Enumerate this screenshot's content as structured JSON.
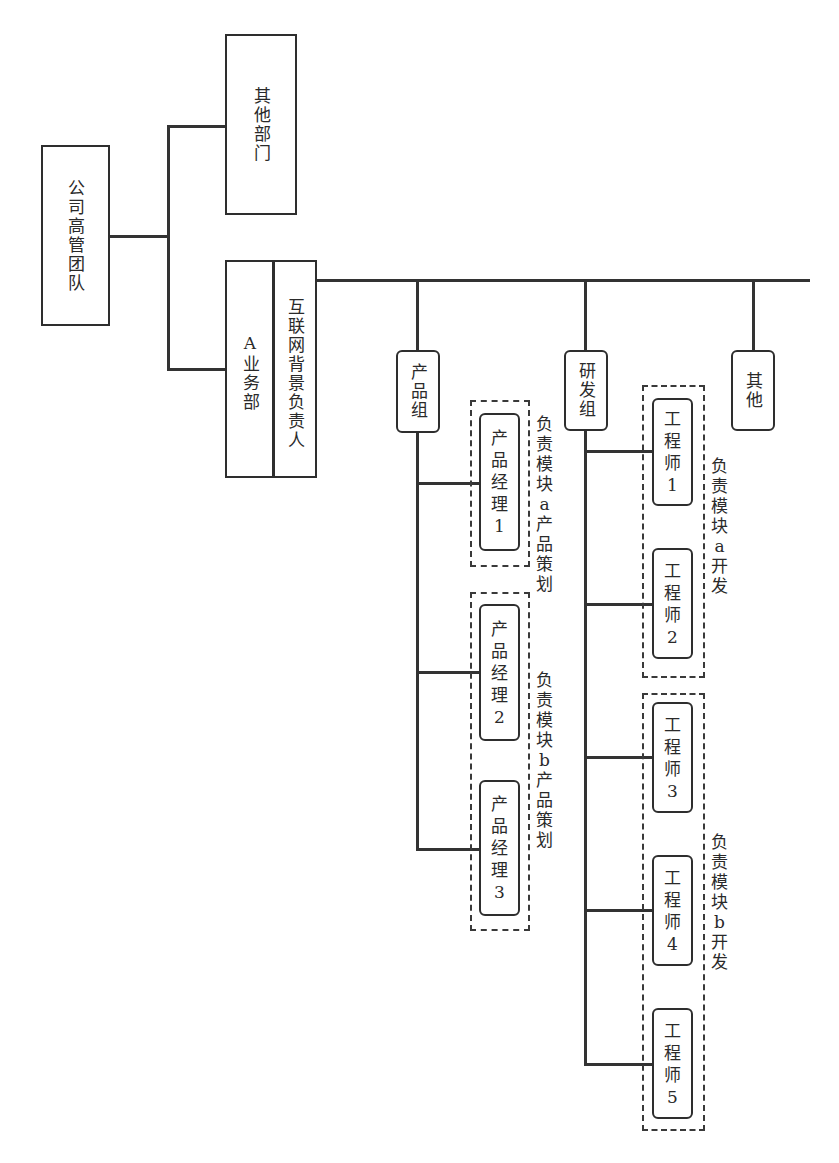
{
  "diagram": {
    "type": "org-chart",
    "nodes": {
      "executive_team": "公司高管团队",
      "other_departments": "其他部门",
      "business_dept_a": "A业务部",
      "internet_lead": "互联网背景负责人",
      "product_group": "产品组",
      "rd_group": "研发组",
      "others": "其他",
      "pm1": [
        "产",
        "品",
        "经",
        "理",
        "1"
      ],
      "pm2": [
        "产",
        "品",
        "经",
        "理",
        "2"
      ],
      "pm3": [
        "产",
        "品",
        "经",
        "理",
        "3"
      ],
      "eng1": [
        "工",
        "程",
        "师",
        "1"
      ],
      "eng2": [
        "工",
        "程",
        "师",
        "2"
      ],
      "eng3": [
        "工",
        "程",
        "师",
        "3"
      ],
      "eng4": [
        "工",
        "程",
        "师",
        "4"
      ],
      "eng5": [
        "工",
        "程",
        "师",
        "5"
      ]
    },
    "annotations": {
      "module_a_product": [
        "负",
        "责",
        "模",
        "块",
        "a",
        "产",
        "品",
        "策",
        "划"
      ],
      "module_b_product": [
        "负",
        "责",
        "模",
        "块",
        "b",
        "产",
        "品",
        "策",
        "划"
      ],
      "module_a_dev": [
        "负",
        "责",
        "模",
        "块",
        "a",
        "开",
        "发"
      ],
      "module_b_dev": [
        "负",
        "责",
        "模",
        "块",
        "b",
        "开",
        "发"
      ]
    },
    "edges": [
      [
        "公司高管团队",
        "其他部门"
      ],
      [
        "公司高管团队",
        "A业务部"
      ],
      [
        "互联网背景负责人",
        "产品组"
      ],
      [
        "互联网背景负责人",
        "研发组"
      ],
      [
        "互联网背景负责人",
        "其他"
      ],
      [
        "产品组",
        "产品经理1"
      ],
      [
        "产品组",
        "产品经理2"
      ],
      [
        "产品组",
        "产品经理3"
      ],
      [
        "研发组",
        "工程师1"
      ],
      [
        "研发组",
        "工程师2"
      ],
      [
        "研发组",
        "工程师3"
      ],
      [
        "研发组",
        "工程师4"
      ],
      [
        "研发组",
        "工程师5"
      ]
    ]
  }
}
